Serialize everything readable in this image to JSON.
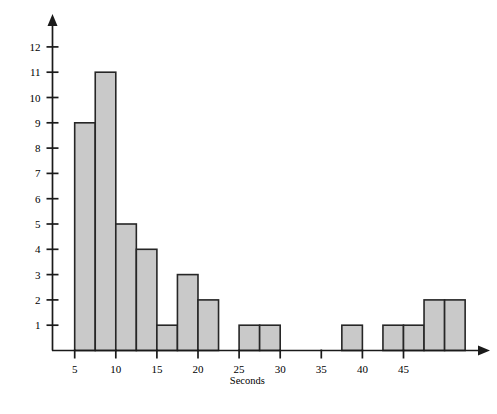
{
  "chart_data": {
    "type": "bar",
    "title": "",
    "subtitle": "",
    "xlabel": "Seconds",
    "ylabel": "",
    "grid": false,
    "legend": null,
    "bin_width": 2.5,
    "bin_start": 5,
    "xlim": [
      3.5,
      48.5
    ],
    "ylim": [
      0,
      12.5
    ],
    "x_ticks": [
      5,
      10,
      15,
      20,
      25,
      30,
      35,
      40,
      45
    ],
    "x_tick_labels": [
      "5",
      "10",
      "15",
      "20",
      "25",
      "30",
      "35",
      "40",
      "45"
    ],
    "y_ticks": [
      1,
      2,
      3,
      4,
      5,
      6,
      7,
      8,
      9,
      10,
      11,
      12
    ],
    "y_tick_labels": [
      "1",
      "2",
      "3",
      "4",
      "5",
      "6",
      "7",
      "8",
      "9",
      "10",
      "11",
      "12"
    ],
    "bins": [
      {
        "start": 5.0,
        "end": 7.5,
        "label": "5.0-7.5",
        "value": 9
      },
      {
        "start": 7.5,
        "end": 10.0,
        "label": "7.5-10.0",
        "value": 11
      },
      {
        "start": 10.0,
        "end": 12.5,
        "label": "10.0-12.5",
        "value": 5
      },
      {
        "start": 12.5,
        "end": 15.0,
        "label": "12.5-15.0",
        "value": 4
      },
      {
        "start": 15.0,
        "end": 17.5,
        "label": "15.0-17.5",
        "value": 1
      },
      {
        "start": 17.5,
        "end": 20.0,
        "label": "17.5-20.0",
        "value": 3
      },
      {
        "start": 20.0,
        "end": 22.5,
        "label": "20.0-22.5",
        "value": 2
      },
      {
        "start": 22.5,
        "end": 25.0,
        "label": "22.5-25.0",
        "value": 0
      },
      {
        "start": 25.0,
        "end": 27.5,
        "label": "25.0-27.5",
        "value": 1
      },
      {
        "start": 27.5,
        "end": 30.0,
        "label": "27.5-30.0",
        "value": 1
      },
      {
        "start": 30.0,
        "end": 32.5,
        "label": "30.0-32.5",
        "value": 0
      },
      {
        "start": 32.5,
        "end": 35.0,
        "label": "32.5-35.0",
        "value": 0
      },
      {
        "start": 35.0,
        "end": 37.5,
        "label": "35.0-37.5",
        "value": 0
      },
      {
        "start": 37.5,
        "end": 40.0,
        "label": "37.5-40.0",
        "value": 1
      },
      {
        "start": 40.0,
        "end": 42.5,
        "label": "40.0-42.5",
        "value": 0
      },
      {
        "start": 42.5,
        "end": 45.0,
        "label": "42.5-45.0",
        "value": 1
      },
      {
        "start": 45.0,
        "end": 47.5,
        "label": "45.0-47.5",
        "value": 1
      },
      {
        "start": 47.5,
        "end": 50.0,
        "label": "47.5-50.0",
        "value": 2
      },
      {
        "start": 50.0,
        "end": 52.5,
        "label": "50.0-52.5",
        "value": 2
      }
    ],
    "categories": [
      "5.0-7.5",
      "7.5-10.0",
      "10.0-12.5",
      "12.5-15.0",
      "15.0-17.5",
      "17.5-20.0",
      "20.0-22.5",
      "22.5-25.0",
      "25.0-27.5",
      "27.5-30.0",
      "30.0-32.5",
      "32.5-35.0",
      "35.0-37.5",
      "37.5-40.0",
      "40.0-42.5",
      "42.5-45.0",
      "45.0-47.5",
      "47.5-50.0",
      "50.0-52.5"
    ],
    "values": [
      9,
      11,
      5,
      4,
      1,
      3,
      2,
      0,
      1,
      1,
      0,
      0,
      0,
      1,
      0,
      1,
      1,
      2,
      2
    ],
    "colors": {
      "bar_fill": "#c9c9c9",
      "bar_stroke": "#262626",
      "axis": "#1a1a1a",
      "text": "#000000",
      "background": "#ffffff"
    }
  }
}
